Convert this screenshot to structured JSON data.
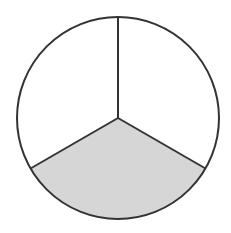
{
  "diagram": {
    "type": "fraction-circle",
    "total_parts": 3,
    "shaded_parts": 1,
    "fraction": "1/3",
    "center": [
      118,
      118
    ],
    "radius": 101,
    "divider_angles_deg": [
      90,
      210,
      330
    ],
    "sectors": [
      {
        "name": "top-right",
        "shaded": false
      },
      {
        "name": "top-left",
        "shaded": false
      },
      {
        "name": "bottom",
        "shaded": true
      }
    ],
    "colors": {
      "stroke": "#333333",
      "shade": "#d6d6d6",
      "background": "#ffffff"
    }
  }
}
